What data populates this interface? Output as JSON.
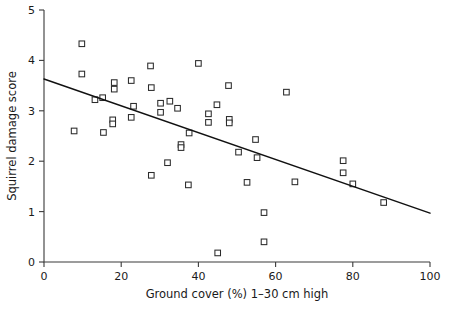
{
  "chart_data": {
    "type": "scatter",
    "title": "",
    "xlabel": "Ground cover (%) 1–30 cm high",
    "ylabel": "Squirrel damage score",
    "xlim": [
      0,
      100
    ],
    "ylim": [
      0,
      5
    ],
    "xticks": [
      0,
      20,
      40,
      60,
      80,
      100
    ],
    "yticks": [
      0,
      1,
      2,
      3,
      4,
      5
    ],
    "xtick_labels": [
      "0",
      "20",
      "40",
      "60",
      "80",
      "100"
    ],
    "ytick_labels": [
      "0",
      "1",
      "2",
      "3",
      "4",
      "5"
    ],
    "grid": false,
    "legend": false,
    "marker_style": "open-square",
    "series": [
      {
        "name": "Squirrel damage observations",
        "points": [
          [
            7.8,
            2.6
          ],
          [
            9.8,
            4.33
          ],
          [
            9.8,
            3.73
          ],
          [
            13.2,
            3.22
          ],
          [
            15.2,
            3.26
          ],
          [
            15.4,
            2.57
          ],
          [
            17.8,
            2.82
          ],
          [
            17.8,
            2.74
          ],
          [
            18.2,
            3.56
          ],
          [
            18.2,
            3.43
          ],
          [
            22.6,
            3.6
          ],
          [
            22.6,
            2.87
          ],
          [
            23.2,
            3.09
          ],
          [
            27.6,
            3.89
          ],
          [
            27.8,
            3.46
          ],
          [
            27.8,
            1.72
          ],
          [
            30.2,
            3.15
          ],
          [
            30.2,
            2.97
          ],
          [
            32.6,
            3.19
          ],
          [
            32.0,
            1.97
          ],
          [
            34.6,
            3.05
          ],
          [
            35.5,
            2.33
          ],
          [
            35.5,
            2.27
          ],
          [
            37.6,
            2.56
          ],
          [
            37.4,
            1.53
          ],
          [
            40.0,
            3.94
          ],
          [
            42.6,
            2.94
          ],
          [
            42.6,
            2.77
          ],
          [
            44.8,
            3.12
          ],
          [
            45.0,
            0.18
          ],
          [
            47.8,
            3.5
          ],
          [
            48.0,
            2.83
          ],
          [
            48.0,
            2.76
          ],
          [
            50.4,
            2.18
          ],
          [
            52.6,
            1.58
          ],
          [
            54.8,
            2.43
          ],
          [
            55.2,
            2.07
          ],
          [
            57.0,
            0.98
          ],
          [
            57.0,
            0.4
          ],
          [
            62.8,
            3.37
          ],
          [
            65.0,
            1.59
          ],
          [
            77.5,
            2.01
          ],
          [
            77.5,
            1.77
          ],
          [
            80.0,
            1.55
          ],
          [
            88.0,
            1.18
          ]
        ]
      }
    ],
    "trendline": {
      "name": "linear regression fit",
      "x_start": 0,
      "y_start": 3.63,
      "x_end": 100,
      "y_end": 0.97
    }
  }
}
